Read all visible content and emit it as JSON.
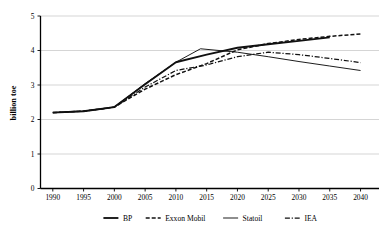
{
  "chart_data": {
    "type": "line",
    "title": "",
    "subtitle": "",
    "xlabel": "",
    "ylabel": "billion toe",
    "xlim": [
      1988,
      2043
    ],
    "ylim": [
      0,
      5
    ],
    "grid": true,
    "grid_axis": "y",
    "legend_position": "bottom",
    "x_ticks": [
      1990,
      1995,
      2000,
      2005,
      2010,
      2015,
      2020,
      2025,
      2030,
      2035,
      2040
    ],
    "y_ticks": [
      0,
      1,
      2,
      3,
      4,
      5
    ],
    "x": [
      1990,
      1995,
      2000,
      2005,
      2010,
      2015,
      2020,
      2025,
      2030,
      2035,
      2040
    ],
    "series": [
      {
        "name": "BP",
        "style": "solid-thick",
        "x": [
          1990,
          1995,
          2000,
          2005,
          2010,
          2015,
          2020,
          2025,
          2030,
          2035
        ],
        "values": [
          2.2,
          2.24,
          2.36,
          3.02,
          3.66,
          3.88,
          4.08,
          4.18,
          4.28,
          4.38
        ]
      },
      {
        "name": "Exxon Mobil",
        "style": "dashed",
        "x": [
          1990,
          1995,
          2000,
          2005,
          2010,
          2015,
          2020,
          2025,
          2030,
          2035,
          2040
        ],
        "values": [
          2.2,
          2.24,
          2.36,
          2.88,
          3.3,
          3.62,
          4.02,
          4.2,
          4.32,
          4.41,
          4.48
        ]
      },
      {
        "name": "Statoil",
        "style": "solid-thin",
        "x": [
          1990,
          1995,
          2000,
          2005,
          2010,
          2014,
          2020,
          2025,
          2030,
          2035,
          2040
        ],
        "values": [
          2.2,
          2.24,
          2.36,
          3.04,
          3.66,
          4.05,
          3.95,
          3.82,
          3.68,
          3.55,
          3.42
        ]
      },
      {
        "name": "IEA",
        "style": "dash-dot",
        "x": [
          1990,
          1995,
          2000,
          2005,
          2010,
          2015,
          2020,
          2025,
          2030,
          2035,
          2040
        ],
        "values": [
          2.2,
          2.24,
          2.36,
          2.94,
          3.42,
          3.58,
          3.82,
          3.95,
          3.88,
          3.77,
          3.65
        ]
      }
    ],
    "colors": {
      "series_stroke": "#111111",
      "gridline": "#b8b8b8",
      "axis": "#000000",
      "background": "#ffffff"
    }
  },
  "legend": {
    "items": [
      {
        "label": "BP",
        "style": "solid-thick"
      },
      {
        "label": "Exxon Mobil",
        "style": "dashed"
      },
      {
        "label": "Statoil",
        "style": "solid-thin"
      },
      {
        "label": "IEA",
        "style": "dash-dot"
      }
    ]
  },
  "axes": {
    "y_title": "billion toe",
    "y_tick_labels": [
      "0",
      "1",
      "2",
      "3",
      "4",
      "5"
    ],
    "x_tick_labels": [
      "1990",
      "1995",
      "2000",
      "2005",
      "2010",
      "2015",
      "2020",
      "2025",
      "2030",
      "2035",
      "2040"
    ]
  }
}
